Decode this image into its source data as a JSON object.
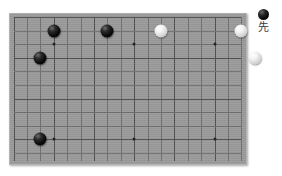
{
  "diagram": {
    "type": "go-board-diagram",
    "board": {
      "columns": 17,
      "rows": 11,
      "grid_color": "#6f6f6f",
      "board_color": "#9a9a9a",
      "partial_board": true,
      "edges_shown": [
        "top",
        "left",
        "right"
      ],
      "star_points": [
        {
          "col": 3,
          "row": 9
        },
        {
          "col": 3,
          "row": 2
        },
        {
          "col": 9,
          "row": 9
        },
        {
          "col": 9,
          "row": 2
        },
        {
          "col": 15,
          "row": 9
        },
        {
          "col": 15,
          "row": 2
        }
      ]
    },
    "stones": [
      {
        "id": "b1",
        "color": "black",
        "col": 3,
        "row": 1
      },
      {
        "id": "b2",
        "color": "black",
        "col": 2,
        "row": 3
      },
      {
        "id": "b3",
        "color": "black",
        "col": 7,
        "row": 1
      },
      {
        "id": "b4",
        "color": "black",
        "col": 2,
        "row": 9
      },
      {
        "id": "w1",
        "color": "white",
        "col": 11,
        "row": 1
      },
      {
        "id": "w2",
        "color": "white",
        "col": 17,
        "row": 1
      },
      {
        "id": "w3",
        "color": "white",
        "col": 18,
        "row": 3
      }
    ],
    "legend": {
      "stone_color": "black",
      "stone_icon": "black-stone-icon",
      "label": "先"
    }
  }
}
